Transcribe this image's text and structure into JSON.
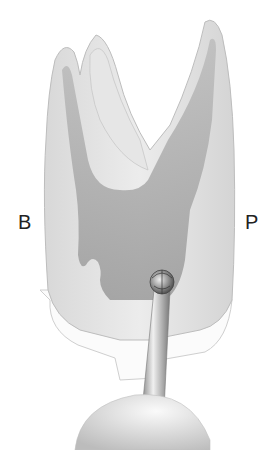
{
  "figure": {
    "labels": {
      "left": "B",
      "right": "P"
    }
  }
}
